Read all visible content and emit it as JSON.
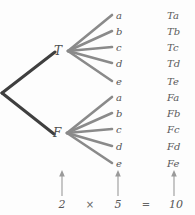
{
  "diagram": {
    "background_color": "#fdfdfd",
    "branch_color_primary": "#3f3f3f",
    "branch_color_secondary": "#8a8a8a",
    "arrow_color": "#9a9a9a",
    "root": {
      "x": 2,
      "y": 93
    },
    "level1": [
      {
        "id": "T",
        "label": "T",
        "x": 58,
        "y": 51
      },
      {
        "id": "F",
        "label": "F",
        "x": 57,
        "y": 133
      }
    ],
    "level2_labels": [
      "a",
      "b",
      "c",
      "d",
      "e",
      "a",
      "b",
      "c",
      "d",
      "e"
    ],
    "leaf_positions_y": [
      16,
      32,
      48,
      64,
      82,
      98,
      114,
      130,
      147,
      164
    ],
    "leaf_x": 116,
    "outcomes": [
      "Ta",
      "Tb",
      "Tc",
      "Td",
      "Te",
      "Fa",
      "Fb",
      "Fc",
      "Fd",
      "Fe"
    ],
    "outcome_x": 167,
    "equation": {
      "terms": [
        "2",
        "5",
        "10"
      ],
      "operators": [
        "×",
        "="
      ],
      "arrow_xs": [
        62,
        118,
        174
      ],
      "arrow_top": 172,
      "arrow_bottom": 196,
      "term_xs": [
        62,
        118,
        176
      ],
      "operator_xs": [
        90,
        146
      ],
      "baseline_y": 200
    }
  }
}
